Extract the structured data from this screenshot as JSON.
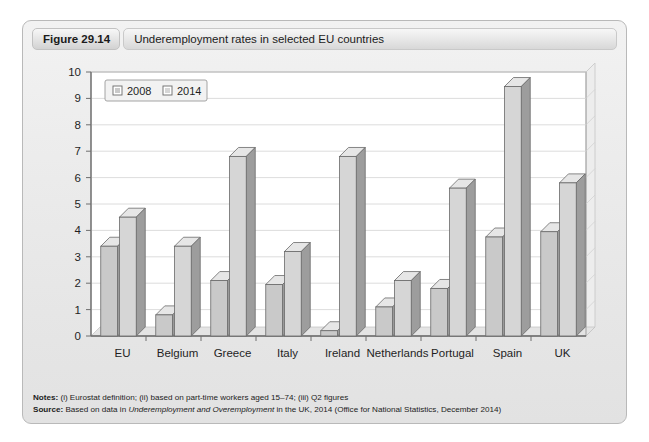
{
  "figure": {
    "number": "Figure 29.14",
    "caption": "Underemployment rates in selected EU countries"
  },
  "chart_data": {
    "type": "bar",
    "title": "Underemployment rates in selected EU countries",
    "xlabel": "",
    "ylabel": "",
    "ylim": [
      0,
      10
    ],
    "ytick_step": 1,
    "yticks": [
      "0",
      "1",
      "2",
      "3",
      "4",
      "5",
      "6",
      "7",
      "8",
      "9",
      "10"
    ],
    "grid": true,
    "legend_position": "top-left",
    "categories": [
      "EU",
      "Belgium",
      "Greece",
      "Italy",
      "Ireland",
      "Netherlands",
      "Portugal",
      "Spain",
      "UK"
    ],
    "series": [
      {
        "name": "2008",
        "color": "#c9c9c9",
        "values": [
          3.4,
          0.8,
          2.1,
          1.95,
          0.2,
          1.1,
          1.8,
          3.75,
          3.95
        ]
      },
      {
        "name": "2014",
        "color": "#d6d6d6",
        "values": [
          4.5,
          3.4,
          6.8,
          3.2,
          6.8,
          2.1,
          5.6,
          9.45,
          5.8
        ]
      }
    ]
  },
  "notes": {
    "notes_label": "Notes:",
    "notes_text": "(i) Eurostat definition; (ii) based on part-time workers aged 15–74; (iii) Q2 figures",
    "source_label": "Source:",
    "source_prefix": "Based on data in ",
    "source_italic": "Underemployment and Overemployment",
    "source_suffix": " in the UK, 2014 (Office for National Statistics, December 2014)"
  }
}
